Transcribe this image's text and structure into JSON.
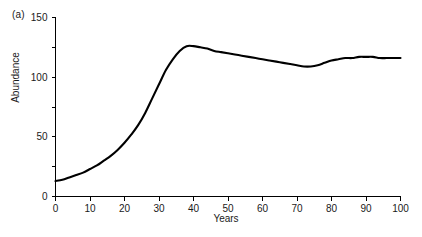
{
  "figure": {
    "panel_label": "(a)"
  },
  "chart_data": {
    "type": "line",
    "title": "",
    "subtitle": "",
    "xlabel": "Years",
    "ylabel": "Abundance",
    "xlim": [
      0,
      100
    ],
    "ylim": [
      0,
      150
    ],
    "grid": false,
    "legend": null,
    "x_major_ticks": [
      0,
      10,
      20,
      30,
      40,
      50,
      60,
      70,
      80,
      90,
      100
    ],
    "x_tick_labels": [
      "0",
      "10",
      "20",
      "30",
      "40",
      "50",
      "60",
      "70",
      "80",
      "90",
      "100"
    ],
    "y_major_ticks": [
      0,
      50,
      100,
      150
    ],
    "y_tick_labels": [
      "0",
      "50",
      "100",
      "150"
    ],
    "y_minor_ticks": [
      25,
      75,
      125
    ],
    "tick_direction": "out",
    "line_color": "#000000",
    "line_width": 2.1,
    "series": [
      {
        "name": "Abundance",
        "x": [
          0,
          2,
          4,
          6,
          8,
          10,
          12,
          14,
          16,
          18,
          20,
          22,
          24,
          26,
          28,
          30,
          32,
          34,
          36,
          38,
          40,
          42,
          44,
          46,
          48,
          50,
          52,
          54,
          56,
          58,
          60,
          62,
          64,
          66,
          68,
          70,
          72,
          74,
          76,
          78,
          80,
          82,
          84,
          86,
          88,
          90,
          92,
          94,
          96,
          98,
          100
        ],
        "values": [
          13,
          14,
          16,
          18,
          20,
          23,
          26,
          30,
          34,
          39,
          45,
          52,
          60,
          70,
          82,
          94,
          106,
          115,
          122,
          126,
          126,
          125,
          124,
          122,
          121,
          120,
          119,
          118,
          117,
          116,
          115,
          114,
          113,
          112,
          111,
          110,
          109,
          109,
          110,
          112,
          114,
          115,
          116,
          116,
          117,
          117,
          117,
          116,
          116,
          116,
          116
        ]
      }
    ],
    "annotations": {
      "peak": {
        "x": 38,
        "y": 126
      },
      "trough": {
        "x": 72,
        "y": 109
      },
      "start": {
        "x": 0,
        "y": 13
      },
      "end": {
        "x": 100,
        "y": 116
      }
    }
  }
}
